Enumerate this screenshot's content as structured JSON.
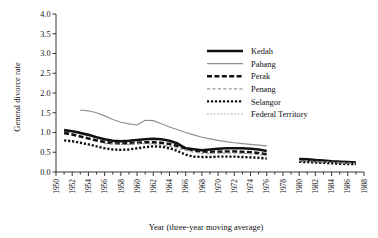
{
  "chart_data": {
    "type": "line",
    "title": "",
    "xlabel": "Year (three-year moving average)",
    "ylabel": "General divorce rate",
    "xlim": [
      1950,
      1988
    ],
    "ylim": [
      0.0,
      4.0
    ],
    "grid": false,
    "legend_position": "upper-right",
    "ytick_labels": [
      "0.0",
      "0.5",
      "1.0",
      "1.5",
      "2.0",
      "2.5",
      "3.0",
      "3.5",
      "4.0"
    ],
    "ytick_values": [
      0.0,
      0.5,
      1.0,
      1.5,
      2.0,
      2.5,
      3.0,
      3.5,
      4.0
    ],
    "xtick_labels": [
      "1950",
      "1952",
      "1954",
      "1956",
      "1958",
      "1960",
      "1962",
      "1964",
      "1966",
      "1968",
      "1970",
      "1972",
      "1974",
      "1976",
      "1978",
      "1980",
      "1982",
      "1984",
      "1986",
      "1988"
    ],
    "xtick_values": [
      1950,
      1952,
      1954,
      1956,
      1958,
      1960,
      1962,
      1964,
      1966,
      1968,
      1970,
      1972,
      1974,
      1976,
      1978,
      1980,
      1982,
      1984,
      1986,
      1988
    ],
    "xtick_minor_step": 1,
    "series": [
      {
        "name": "Kedah",
        "color": "#111111",
        "style": "solid",
        "width": 2.6,
        "x": [
          1951,
          1952,
          1953,
          1954,
          1955,
          1956,
          1957,
          1958,
          1959,
          1960,
          1961,
          1962,
          1963,
          1964,
          1965,
          1966,
          1968,
          1969,
          1970,
          1971,
          1972,
          1973,
          1974,
          1975,
          1976,
          1980,
          1981,
          1982,
          1983,
          1984,
          1985,
          1986,
          1987
        ],
        "y": [
          1.06,
          1.03,
          0.99,
          0.94,
          0.88,
          0.83,
          0.79,
          0.78,
          0.79,
          0.81,
          0.83,
          0.84,
          0.83,
          0.79,
          0.72,
          0.6,
          0.55,
          0.57,
          0.59,
          0.6,
          0.6,
          0.6,
          0.59,
          0.57,
          0.53,
          0.33,
          0.32,
          0.3,
          0.29,
          0.27,
          0.26,
          0.25,
          0.24
        ]
      },
      {
        "name": "Pahang",
        "color": "#8f8f8f",
        "style": "solid",
        "width": 1.2,
        "x": [
          1953,
          1954,
          1955,
          1956,
          1957,
          1958,
          1959,
          1960,
          1961,
          1962,
          1963,
          1964,
          1965,
          1966,
          1967,
          1968,
          1969,
          1970,
          1971,
          1972,
          1973,
          1974,
          1975,
          1976
        ],
        "y": [
          1.57,
          1.55,
          1.5,
          1.42,
          1.33,
          1.26,
          1.22,
          1.19,
          1.31,
          1.3,
          1.22,
          1.14,
          1.07,
          1.0,
          0.94,
          0.88,
          0.84,
          0.8,
          0.77,
          0.74,
          0.72,
          0.7,
          0.68,
          0.66
        ]
      },
      {
        "name": "Perak",
        "color": "#111111",
        "style": "dashed",
        "width": 2.6,
        "x": [
          1951,
          1952,
          1953,
          1954,
          1955,
          1956,
          1957,
          1958,
          1959,
          1960,
          1961,
          1962,
          1963,
          1964,
          1965,
          1966,
          1967,
          1968,
          1969,
          1970,
          1971,
          1972,
          1973,
          1974,
          1975,
          1976,
          1980,
          1981,
          1982,
          1983,
          1984,
          1985,
          1986,
          1987
        ],
        "y": [
          0.99,
          0.95,
          0.9,
          0.85,
          0.8,
          0.76,
          0.73,
          0.72,
          0.73,
          0.74,
          0.75,
          0.75,
          0.74,
          0.71,
          0.66,
          0.6,
          0.55,
          0.52,
          0.51,
          0.51,
          0.52,
          0.52,
          0.51,
          0.5,
          0.48,
          0.45,
          0.3,
          0.29,
          0.28,
          0.27,
          0.26,
          0.25,
          0.24,
          0.23
        ]
      },
      {
        "name": "Penang",
        "color": "#9a9a9a",
        "style": "dashed",
        "width": 1.2,
        "x": [
          1956,
          1957,
          1958,
          1959,
          1960,
          1961,
          1962,
          1963,
          1964,
          1965,
          1966,
          1967,
          1968,
          1969,
          1970,
          1971,
          1972,
          1973,
          1974,
          1975,
          1976,
          1980,
          1981,
          1982,
          1983,
          1984,
          1985,
          1986,
          1987
        ],
        "y": [
          0.72,
          0.71,
          0.7,
          0.7,
          0.71,
          0.72,
          0.71,
          0.69,
          0.65,
          0.6,
          0.55,
          0.5,
          0.47,
          0.47,
          0.48,
          0.48,
          0.48,
          0.47,
          0.46,
          0.44,
          0.42,
          0.29,
          0.28,
          0.27,
          0.26,
          0.25,
          0.24,
          0.23,
          0.22
        ]
      },
      {
        "name": "Selangor",
        "color": "#111111",
        "style": "dotted",
        "width": 2.4,
        "x": [
          1951,
          1952,
          1953,
          1954,
          1955,
          1956,
          1957,
          1958,
          1959,
          1960,
          1961,
          1962,
          1963,
          1964,
          1965,
          1966,
          1967,
          1968,
          1969,
          1970,
          1971,
          1972,
          1973,
          1974,
          1975,
          1976,
          1980,
          1981,
          1982,
          1983,
          1984,
          1985,
          1986,
          1987
        ],
        "y": [
          0.8,
          0.78,
          0.74,
          0.7,
          0.65,
          0.6,
          0.57,
          0.56,
          0.57,
          0.6,
          0.63,
          0.65,
          0.64,
          0.6,
          0.53,
          0.44,
          0.39,
          0.38,
          0.38,
          0.39,
          0.39,
          0.39,
          0.38,
          0.37,
          0.36,
          0.34,
          0.26,
          0.25,
          0.24,
          0.23,
          0.22,
          0.21,
          0.2,
          0.2
        ]
      },
      {
        "name": "Federal Territory",
        "color": "#a5a5a5",
        "style": "dotted",
        "width": 1.2,
        "x": [
          1980,
          1981,
          1982,
          1983,
          1984,
          1985,
          1986,
          1987
        ],
        "y": [
          0.28,
          0.27,
          0.26,
          0.25,
          0.24,
          0.23,
          0.22,
          0.21
        ]
      }
    ]
  },
  "legend": {
    "entries": [
      {
        "label": "Kedah"
      },
      {
        "label": "Pahang"
      },
      {
        "label": "Perak"
      },
      {
        "label": "Penang"
      },
      {
        "label": "Selangor"
      },
      {
        "label": "Federal Territory"
      }
    ]
  }
}
